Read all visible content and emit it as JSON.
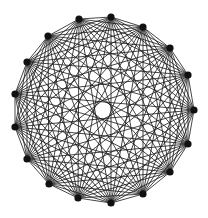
{
  "diagram": {
    "type": "complete-graph",
    "name": "K17",
    "vertex_count": 17,
    "edge_color": "#1a1a1a",
    "vertex_color": "#111111",
    "background": "#ffffff",
    "vertices": [
      {
        "id": 0,
        "x": 111,
        "y": 17
      },
      {
        "id": 1,
        "x": 143,
        "y": 27
      },
      {
        "id": 2,
        "x": 170,
        "y": 48
      },
      {
        "id": 3,
        "x": 188,
        "y": 75
      },
      {
        "id": 4,
        "x": 194,
        "y": 110
      },
      {
        "id": 5,
        "x": 188,
        "y": 144
      },
      {
        "id": 6,
        "x": 170,
        "y": 172
      },
      {
        "id": 7,
        "x": 143,
        "y": 194
      },
      {
        "id": 8,
        "x": 111,
        "y": 203
      },
      {
        "id": 9,
        "x": 78,
        "y": 198
      },
      {
        "id": 10,
        "x": 49,
        "y": 184
      },
      {
        "id": 11,
        "x": 27,
        "y": 159
      },
      {
        "id": 12,
        "x": 15,
        "y": 127
      },
      {
        "id": 13,
        "x": 15,
        "y": 94
      },
      {
        "id": 14,
        "x": 27,
        "y": 62
      },
      {
        "id": 15,
        "x": 48,
        "y": 36
      },
      {
        "id": 16,
        "x": 79,
        "y": 19
      }
    ]
  }
}
